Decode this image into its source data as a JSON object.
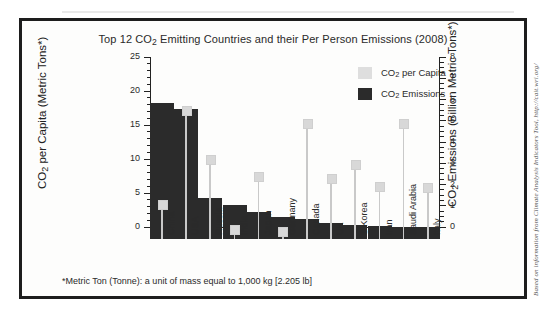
{
  "figure": {
    "title": "Top 12 CO2 Emitting Countries and their Per Person Emissions (2008)",
    "title_prefix": "Top 12 CO",
    "title_sub": "2",
    "title_suffix": " Emitting Countries and their Per Person Emissions (2008)",
    "footnote": "*Metric Ton (Tonne): a unit of mass equal to 1,000 kg [2.205 lb]",
    "side_credit": "Based on information from Climate Analysis Indicators Tool, http://cait.wri.org/",
    "frame_color": "#1d1d1d",
    "background": "#fdfdfc"
  },
  "legend": {
    "position": "top-right",
    "items": [
      {
        "label_prefix": "CO",
        "label_sub": "2",
        "label_suffix": " per Capita",
        "color": "#dedede"
      },
      {
        "label_prefix": "CO",
        "label_sub": "2",
        "label_suffix": " Emissions",
        "color": "#2b2b2b"
      }
    ]
  },
  "axes": {
    "left": {
      "title_prefix": "CO",
      "title_sub": "2",
      "title_suffix": " per Capita (Metric Tons*)",
      "ticks": [
        "0",
        "5",
        "10",
        "15",
        "20",
        "25"
      ],
      "min": 0,
      "max": 25,
      "minor_step": 1
    },
    "right": {
      "title_prefix": "CO",
      "title_sub": "2",
      "title_suffix": " Emissions (Billion Metric Tons*)",
      "ticks": [
        "0",
        "1",
        "2",
        "3",
        "4",
        "5",
        "6",
        "7",
        "8"
      ],
      "min": 0,
      "max": 8,
      "minor_step": 0.25
    }
  },
  "chart_data": {
    "type": "bar",
    "title": "Top 12 CO2 Emitting Countries and their Per Person Emissions (2008)",
    "categories": [
      "China",
      "USA",
      "Russia",
      "India",
      "Japan",
      "Germany",
      "Canada",
      "UK",
      "S Korea",
      "Iran",
      "Saudi Arabia",
      "Italy"
    ],
    "xlabel": "",
    "ylabel": "CO2 per Capita (Metric Tons*)",
    "y2label": "CO2 Emissions (Billion Metric Tons*)",
    "ylim": [
      0,
      25
    ],
    "y2lim": [
      0,
      8
    ],
    "grid": false,
    "legend": [
      "CO2 per Capita",
      "CO2 Emissions"
    ],
    "series": [
      {
        "name": "CO2 Emissions",
        "axis": "right",
        "unit": "Billion Metric Tons",
        "marker": "bar",
        "color": "#2b2b2b",
        "values": [
          6.4,
          6.1,
          1.95,
          1.6,
          1.28,
          1.05,
          0.96,
          0.77,
          0.65,
          0.63,
          0.58,
          0.58
        ]
      },
      {
        "name": "CO2 per Capita",
        "axis": "left",
        "unit": "Metric Tons",
        "marker": "lollipop",
        "color": "#d8d8d8",
        "values": [
          5.1,
          19.0,
          11.7,
          1.4,
          9.2,
          1.2,
          17.0,
          8.9,
          11.1,
          7.8,
          17.1,
          7.6
        ]
      }
    ]
  }
}
